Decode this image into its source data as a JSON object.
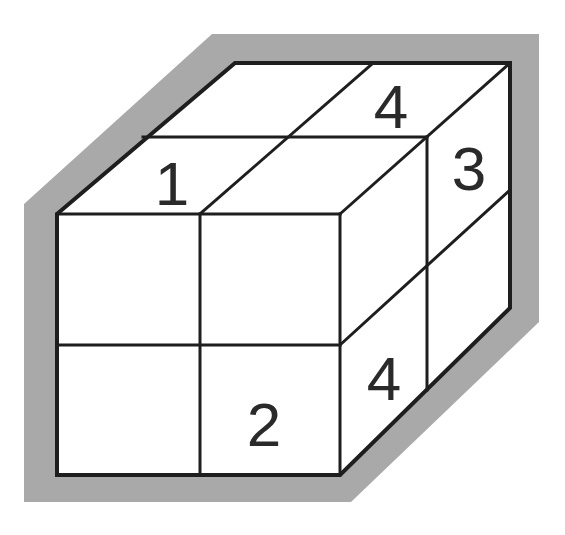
{
  "diagram": {
    "type": "2x2x2 cube puzzle (isometric view)",
    "colors": {
      "shadow": "#a9a9a9",
      "face_fill": "#ffffff",
      "edge": "#1e1e1e",
      "digit": "#2a2a2a"
    },
    "faces": {
      "top": {
        "cells": [
          {
            "position": "back-left",
            "label": ""
          },
          {
            "position": "back-right",
            "label": "4"
          },
          {
            "position": "front-left",
            "label": "1"
          },
          {
            "position": "front-right",
            "label": ""
          }
        ]
      },
      "front": {
        "cells": [
          {
            "position": "top-left",
            "label": ""
          },
          {
            "position": "top-right",
            "label": ""
          },
          {
            "position": "bottom-left",
            "label": ""
          },
          {
            "position": "bottom-right",
            "label": "2"
          }
        ]
      },
      "right": {
        "cells": [
          {
            "position": "top-front",
            "label": ""
          },
          {
            "position": "top-back",
            "label": "3"
          },
          {
            "position": "bottom-front",
            "label": "4"
          },
          {
            "position": "bottom-back",
            "label": ""
          }
        ]
      }
    },
    "labels": {
      "top_front_left": "1",
      "top_back_right": "4",
      "right_top_back": "3",
      "right_bottom_front": "4",
      "front_bottom_right": "2"
    }
  }
}
